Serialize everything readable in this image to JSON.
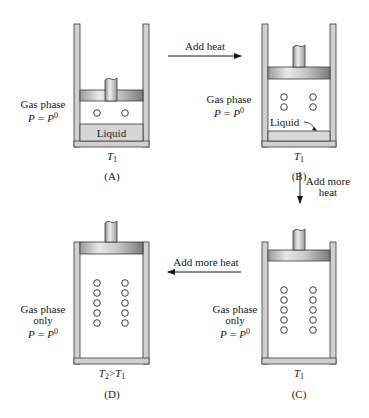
{
  "figure": {
    "colors": {
      "wall": "#d0d0d0",
      "wall_stroke": "#3a3a3a",
      "liquid": "#d6d6d6",
      "piston_light": "#f0f0f0",
      "piston_dark": "#8a8a8a",
      "arrow": "#1a1a1a"
    },
    "panels": [
      {
        "id": "A",
        "caption": "(A)",
        "temperature": {
          "symbol": "T",
          "subscript": "1"
        },
        "phase_label": [
          "Gas phase"
        ],
        "pressure": {
          "lhs": "P",
          "rhs": "P",
          "sup": "0"
        },
        "liquid_label": "Liquid",
        "bubble_columns": 2,
        "bubbles_per_column": 1
      },
      {
        "id": "B",
        "caption": "(B)",
        "temperature": {
          "symbol": "T",
          "subscript": "1"
        },
        "phase_label": [
          "Gas phase"
        ],
        "pressure": {
          "lhs": "P",
          "rhs": "P",
          "sup": "0"
        },
        "liquid_label": "Liquid",
        "bubble_columns": 2,
        "bubbles_per_column": 2
      },
      {
        "id": "C",
        "caption": "(C)",
        "temperature": {
          "symbol": "T",
          "subscript": "1"
        },
        "phase_label": [
          "Gas phase",
          "only"
        ],
        "pressure": {
          "lhs": "P",
          "rhs": "P",
          "sup": "0"
        },
        "bubble_columns": 2,
        "bubbles_per_column": 5
      },
      {
        "id": "D",
        "caption": "(D)",
        "temperature": {
          "symbol": "T",
          "subscript": "2",
          "relation": ">",
          "symbol2": "T",
          "subscript2": "1"
        },
        "phase_label": [
          "Gas phase",
          "only"
        ],
        "pressure": {
          "lhs": "P",
          "rhs": "P",
          "sup": "0"
        },
        "bubble_columns": 2,
        "bubbles_per_column": 5
      }
    ],
    "arrows": [
      {
        "from": "A",
        "to": "B",
        "direction": "right",
        "label": [
          "Add heat"
        ]
      },
      {
        "from": "B",
        "to": "C",
        "direction": "down",
        "label": [
          "Add more",
          "heat"
        ]
      },
      {
        "from": "C",
        "to": "D",
        "direction": "left",
        "label": [
          "Add more heat"
        ]
      }
    ]
  }
}
